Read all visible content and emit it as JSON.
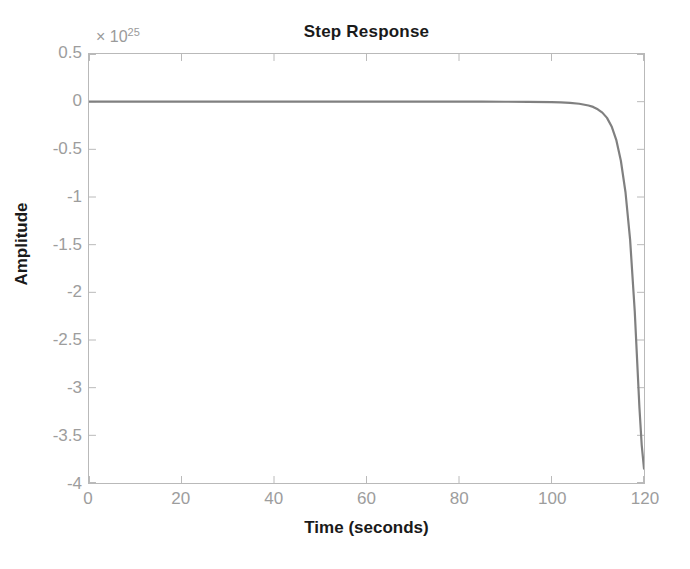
{
  "figure": {
    "background": "#ffffff",
    "title": "Step Response"
  },
  "axes": {
    "box_color": "#b9b9b9",
    "tick_label_color": "#9d9d9d",
    "label_color": "#1a1a1a"
  },
  "y_axis": {
    "label": "Amplitude",
    "exponent_prefix": "× 10",
    "exponent_power": "25",
    "tick_labels": [
      "0.5",
      "0",
      "-0.5",
      "-1",
      "-1.5",
      "-2",
      "-2.5",
      "-3",
      "-3.5",
      "-4"
    ],
    "tick_values": [
      0.5,
      0,
      -0.5,
      -1,
      -1.5,
      -2,
      -2.5,
      -3,
      -3.5,
      -4
    ]
  },
  "x_axis": {
    "label": "Time (seconds)",
    "tick_labels": [
      "0",
      "20",
      "40",
      "60",
      "80",
      "100",
      "120"
    ],
    "tick_values": [
      0,
      20,
      40,
      60,
      80,
      100,
      120
    ]
  },
  "chart_data": {
    "type": "line",
    "title": "Step Response",
    "xlabel": "Time (seconds)",
    "ylabel": "Amplitude",
    "xlim": [
      0,
      120
    ],
    "ylim": [
      -4,
      0.5
    ],
    "y_scale_exponent": 25,
    "y_scale_label": "× 10^25",
    "grid": false,
    "legend": false,
    "series": [
      {
        "name": "step response",
        "color": "#808080",
        "line_width": 2.2,
        "x": [
          0,
          5,
          10,
          15,
          20,
          25,
          30,
          35,
          40,
          45,
          50,
          55,
          60,
          65,
          70,
          75,
          80,
          85,
          90,
          95,
          100,
          102,
          104,
          106,
          108,
          109,
          110,
          111,
          112,
          113,
          114,
          115,
          116,
          117,
          118,
          119,
          119.5,
          120
        ],
        "y": [
          0,
          0,
          0,
          0,
          0,
          0,
          0,
          0,
          0,
          0,
          0,
          0,
          0,
          0,
          0,
          0,
          0,
          0,
          -0.001,
          -0.002,
          -0.005,
          -0.008,
          -0.013,
          -0.022,
          -0.04,
          -0.055,
          -0.08,
          -0.115,
          -0.17,
          -0.26,
          -0.4,
          -0.62,
          -0.95,
          -1.45,
          -2.2,
          -3.2,
          -3.6,
          -3.85
        ]
      }
    ]
  }
}
